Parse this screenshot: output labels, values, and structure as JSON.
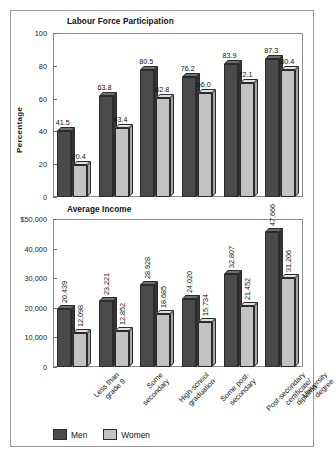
{
  "chart_data": [
    {
      "type": "bar",
      "title": "Labour Force Participation",
      "xlabel": "",
      "ylabel": "Percentage",
      "ylim": [
        0,
        100
      ],
      "yticks": [
        "0",
        "20",
        "40",
        "60",
        "80",
        "100"
      ],
      "grid": false,
      "legend_position": "bottom",
      "categories": [
        "Less than\ngrade 9",
        "Some\nsecondary",
        "High-school\ngraduation",
        "Some post-\nsecondary",
        "Post-secondary\ncertificate/\ndiploma",
        "University\ndegree"
      ],
      "series": [
        {
          "name": "Men",
          "values": [
            41.5,
            63.8,
            80.5,
            76.2,
            83.9,
            87.3
          ],
          "labels": [
            "41.5",
            "63.8",
            "80.5",
            "76.2",
            "83.9",
            "87.3"
          ]
        },
        {
          "name": "Women",
          "values": [
            20.4,
            43.4,
            62.8,
            66.0,
            72.1,
            80.4
          ],
          "labels": [
            "20.4",
            "43.4",
            "62.8",
            "66.0",
            "72.1",
            "80.4"
          ]
        }
      ]
    },
    {
      "type": "bar",
      "title": "Average Income",
      "xlabel": "",
      "ylabel": "",
      "ylim": [
        0,
        50000
      ],
      "yticks": [
        "0",
        "10,000",
        "20,000",
        "30,000",
        "40,000",
        "$50,000"
      ],
      "grid": false,
      "legend_position": "bottom",
      "categories": [
        "Less than\ngrade 9",
        "Some\nsecondary",
        "High-school\ngraduation",
        "Some post-\nsecondary",
        "Post-secondary\ncertificate/\ndiploma",
        "University\ndegree"
      ],
      "series": [
        {
          "name": "Men",
          "values": [
            20439,
            23221,
            28928,
            24020,
            32807,
            47666
          ],
          "labels": [
            "20,439",
            "23,221",
            "28,928",
            "24,020",
            "32,807",
            "47,666"
          ]
        },
        {
          "name": "Women",
          "values": [
            12098,
            12852,
            18685,
            15734,
            21452,
            31206
          ],
          "labels": [
            "12,098",
            "12,852",
            "18,685",
            "15,734",
            "21,452",
            "31,206"
          ]
        }
      ]
    }
  ],
  "legend": {
    "men_label": "Men",
    "women_label": "Women"
  },
  "colors": {
    "men": "#4a4a4a",
    "women": "#c2c2c2",
    "axis": "#8c8c8c",
    "border": "#9a9a9a"
  }
}
